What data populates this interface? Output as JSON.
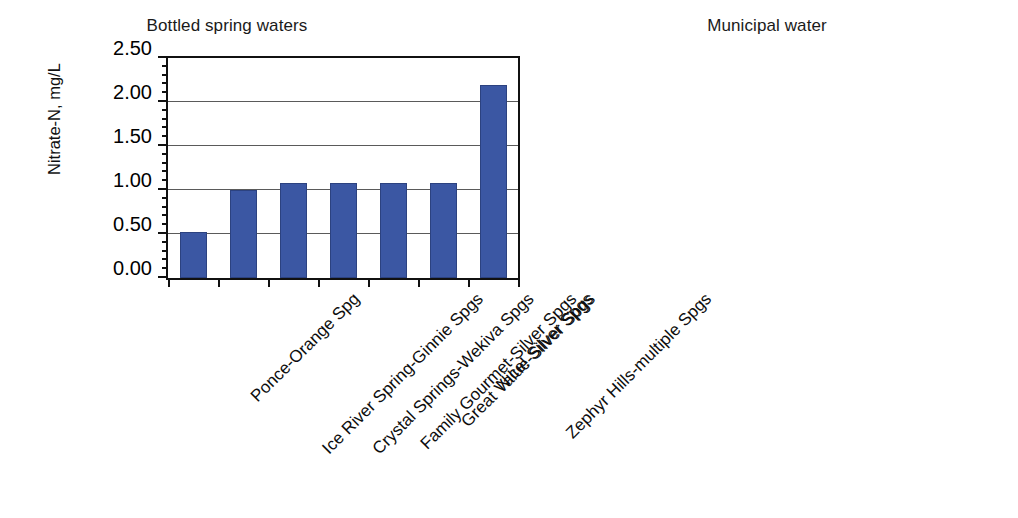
{
  "figure": {
    "background": "#ffffff",
    "bar_color": "#3b57a3",
    "axis_color": "#111111",
    "grid_color": "#5a5a5a"
  },
  "chart_data": [
    {
      "type": "bar",
      "title": "Bottled spring waters",
      "xlabel": "",
      "ylabel": "Nitrate-N, mg/L",
      "ylim": [
        0,
        2.5
      ],
      "yticks": [
        0.0,
        0.5,
        1.0,
        1.5,
        2.0,
        2.5
      ],
      "ytick_labels": [
        "0.00",
        "0.50",
        "1.00",
        "1.50",
        "2.00",
        "2.50"
      ],
      "y_minor_tick_interval": 0.1,
      "grid": "horizontal",
      "legend": "none",
      "categories": [
        "Ponce-Orange Spg",
        "Ice River Spring-Ginnie Spgs",
        "Crystal Springs-Wekiva Spgs",
        "Family Gourmet-Silver Spgs",
        "Great Value-Silver Spgs",
        "Nice! Silver Spgs",
        "Zephyr Hills-multiple Spgs"
      ],
      "values": [
        0.52,
        1.0,
        1.08,
        1.08,
        1.08,
        1.08,
        2.19
      ]
    },
    {
      "type": "bar",
      "title": "Municipal water",
      "xlabel": "",
      "ylabel": "",
      "ylim": [
        0,
        2.5
      ],
      "yticks": [
        0.0,
        0.5,
        1.0,
        1.5,
        2.0,
        2.5
      ],
      "ytick_labels": [
        "",
        "",
        "",
        "",
        "",
        ""
      ],
      "grid": "horizontal",
      "legend": "none",
      "categories": [
        "Waldo",
        "Micanopy",
        "Jonesville",
        "Gainesville",
        "LaCrosse",
        "High Springs",
        "Melrose",
        "Alachua",
        "Hawthorne",
        "Archer",
        "Newberry"
      ],
      "values": [
        0.005,
        0.005,
        0.01,
        0.02,
        0.03,
        0.05,
        0.11,
        0.27,
        0.37,
        1.4,
        1.7
      ]
    }
  ]
}
